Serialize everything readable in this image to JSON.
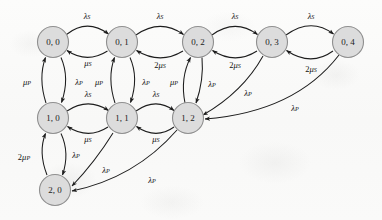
{
  "diagram": {
    "type": "markov-chain-state-transition-diagram",
    "title": "",
    "node_radius": 15.5,
    "colors": {
      "background": "#fbfbfa",
      "node_fill": "#dcdcdc",
      "node_stroke": "#8f8f8f",
      "edge_stroke": "#1d1d1d",
      "label_text": "#111111"
    },
    "rate_symbols": {
      "lambda_s": "λS",
      "mu_s": "μS",
      "two_mu_s": "2μS",
      "lambda_p": "λP",
      "mu_p": "μP",
      "two_mu_p": "2μP"
    },
    "nodes": [
      {
        "id": "0_0",
        "label": "0, 0",
        "x": 53,
        "y": 42,
        "row": 0,
        "col": 0
      },
      {
        "id": "0_1",
        "label": "0, 1",
        "x": 122,
        "y": 42,
        "row": 0,
        "col": 1
      },
      {
        "id": "0_2",
        "label": "0, 2",
        "x": 198,
        "y": 42,
        "row": 0,
        "col": 2
      },
      {
        "id": "0_3",
        "label": "0, 3",
        "x": 272,
        "y": 42,
        "row": 0,
        "col": 3
      },
      {
        "id": "0_4",
        "label": "0, 4",
        "x": 348,
        "y": 42,
        "row": 0,
        "col": 4
      },
      {
        "id": "1_0",
        "label": "1, 0",
        "x": 53,
        "y": 118,
        "row": 1,
        "col": 0
      },
      {
        "id": "1_1",
        "label": "1, 1",
        "x": 122,
        "y": 118,
        "row": 1,
        "col": 1
      },
      {
        "id": "1_2",
        "label": "1, 2",
        "x": 188,
        "y": 118,
        "row": 1,
        "col": 2
      },
      {
        "id": "2_0",
        "label": "2, 0",
        "x": 55,
        "y": 190,
        "row": 2,
        "col": 0
      }
    ],
    "edges": [
      {
        "from": "0_0",
        "to": "0_1",
        "rate": "λ",
        "sub": "S",
        "coef": "",
        "label_x": 87,
        "label_y": 16
      },
      {
        "from": "0_1",
        "to": "0_0",
        "rate": "μ",
        "sub": "S",
        "coef": "",
        "label_x": 88,
        "label_y": 63
      },
      {
        "from": "0_1",
        "to": "0_2",
        "rate": "λ",
        "sub": "S",
        "coef": "",
        "label_x": 160,
        "label_y": 16
      },
      {
        "from": "0_2",
        "to": "0_1",
        "rate": "μ",
        "sub": "S",
        "coef": "2",
        "label_x": 160,
        "label_y": 65
      },
      {
        "from": "0_2",
        "to": "0_3",
        "rate": "λ",
        "sub": "S",
        "coef": "",
        "label_x": 235,
        "label_y": 16
      },
      {
        "from": "0_3",
        "to": "0_2",
        "rate": "μ",
        "sub": "S",
        "coef": "2",
        "label_x": 235,
        "label_y": 65
      },
      {
        "from": "0_3",
        "to": "0_4",
        "rate": "λ",
        "sub": "S",
        "coef": "",
        "label_x": 311,
        "label_y": 16
      },
      {
        "from": "0_4",
        "to": "0_3",
        "rate": "μ",
        "sub": "S",
        "coef": "2",
        "label_x": 311,
        "label_y": 69
      },
      {
        "from": "1_0",
        "to": "1_1",
        "rate": "λ",
        "sub": "S",
        "coef": "",
        "label_x": 88,
        "label_y": 94
      },
      {
        "from": "1_1",
        "to": "1_0",
        "rate": "μ",
        "sub": "S",
        "coef": "",
        "label_x": 88,
        "label_y": 139
      },
      {
        "from": "1_1",
        "to": "1_2",
        "rate": "λ",
        "sub": "S",
        "coef": "",
        "label_x": 156,
        "label_y": 94
      },
      {
        "from": "1_2",
        "to": "1_1",
        "rate": "μ",
        "sub": "S",
        "coef": "",
        "label_x": 156,
        "label_y": 139
      },
      {
        "from": "1_0",
        "to": "0_0",
        "rate": "μ",
        "sub": "P",
        "coef": "",
        "label_x": 27,
        "label_y": 82
      },
      {
        "from": "0_0",
        "to": "1_0",
        "rate": "λ",
        "sub": "P",
        "coef": "",
        "label_x": 79,
        "label_y": 82
      },
      {
        "from": "1_1",
        "to": "0_1",
        "rate": "μ",
        "sub": "P",
        "coef": "",
        "label_x": 99,
        "label_y": 82
      },
      {
        "from": "0_1",
        "to": "1_1",
        "rate": "λ",
        "sub": "P",
        "coef": "",
        "label_x": 146,
        "label_y": 82
      },
      {
        "from": "1_2",
        "to": "0_2",
        "rate": "μ",
        "sub": "P",
        "coef": "",
        "label_x": 174,
        "label_y": 82
      },
      {
        "from": "0_2",
        "to": "1_2",
        "rate": "λ",
        "sub": "P",
        "coef": "",
        "label_x": 212,
        "label_y": 84
      },
      {
        "from": "2_0",
        "to": "1_0",
        "rate": "μ",
        "sub": "P",
        "coef": "2",
        "label_x": 24,
        "label_y": 157
      },
      {
        "from": "1_0",
        "to": "2_0",
        "rate": "λ",
        "sub": "P",
        "coef": "",
        "label_x": 76,
        "label_y": 155
      },
      {
        "from": "1_1",
        "to": "2_0",
        "rate": "λ",
        "sub": "P",
        "coef": "",
        "label_x": 106,
        "label_y": 170
      },
      {
        "from": "1_2",
        "to": "2_0",
        "rate": "λ",
        "sub": "P",
        "coef": "",
        "label_x": 152,
        "label_y": 180
      },
      {
        "from": "0_3",
        "to": "1_2",
        "rate": "λ",
        "sub": "P",
        "coef": "",
        "label_x": 248,
        "label_y": 93
      },
      {
        "from": "0_4",
        "to": "1_2",
        "rate": "λ",
        "sub": "P",
        "coef": "",
        "label_x": 295,
        "label_y": 108
      }
    ]
  }
}
